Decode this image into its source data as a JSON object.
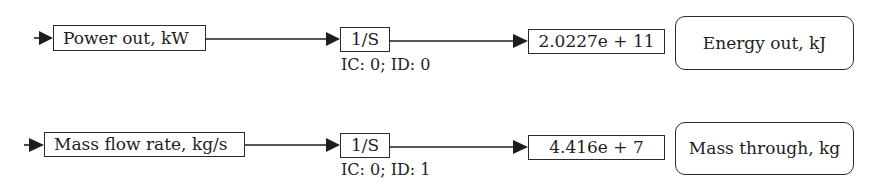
{
  "diagram": {
    "type": "block-diagram",
    "rows": [
      {
        "source_label": "Power out, kW",
        "integrator": {
          "label": "1/S",
          "params": "IC: 0; ID: 0"
        },
        "display_value": "2.0227e + 11",
        "output_label": "Energy out, kJ"
      },
      {
        "source_label": "Mass flow rate, kg/s",
        "integrator": {
          "label": "1/S",
          "params": "IC: 0; ID: 1"
        },
        "display_value": "4.416e + 7",
        "output_label": "Mass through, kg"
      }
    ],
    "colors": {
      "line": "#1e1e1e",
      "background": "#ffffff"
    }
  }
}
